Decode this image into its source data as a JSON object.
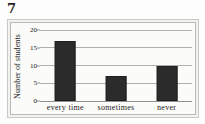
{
  "figure": {
    "label": "7"
  },
  "chart_data": {
    "type": "bar",
    "title": "",
    "xlabel": "",
    "ylabel": "Number of students",
    "categories": [
      "every time",
      "sometimes",
      "never"
    ],
    "values": [
      17,
      7,
      10
    ],
    "ylim": [
      0,
      20
    ],
    "yticks": [
      0,
      5,
      10,
      15,
      20
    ],
    "ytick_labels": [
      "0",
      "5",
      "10",
      "15",
      "20"
    ],
    "grid": true,
    "legend": false,
    "bar_color": "#2b2b2b",
    "background_color": "#fbfbf9"
  }
}
